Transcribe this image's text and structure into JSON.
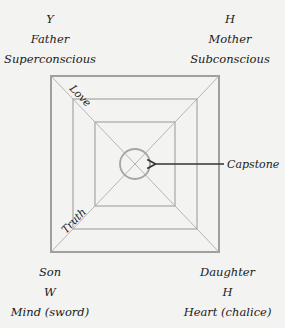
{
  "corners": {
    "top_left": [
      "Y",
      "Father",
      "Superconscious"
    ],
    "top_right": [
      "H",
      "Mother",
      "Subconscious"
    ],
    "bottom_left": [
      "Son",
      "W",
      "Mind (sword)"
    ],
    "bottom_right": [
      "Daughter",
      "H",
      "Heart (chalice)"
    ]
  },
  "diagonal_labels": {
    "upper_left": "Love",
    "lower_left": "Truth"
  },
  "center": {
    "callout": "Capstone"
  },
  "colors": {
    "background": "#f3f3f2",
    "line": "#a8a8a8",
    "text": "#1a1a1a",
    "arrow": "#333333"
  }
}
